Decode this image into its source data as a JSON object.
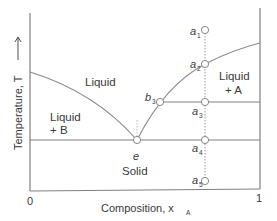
{
  "diagram": {
    "type": "phase-diagram",
    "title": "",
    "xlabel": "Composition, x",
    "xlabel_sub": "A",
    "ylabel": "Temperature, T",
    "ylabel_arrow": "→",
    "x_ticks": [
      "0",
      "1"
    ],
    "regions": {
      "liquid": "Liquid",
      "liquid_a_line1": "Liquid",
      "liquid_a_line2": "+ A",
      "liquid_b_line1": "Liquid",
      "liquid_b_line2": "+ B",
      "solid": "Solid"
    },
    "points": {
      "e": "e",
      "b3": "b",
      "b3_sub": "3",
      "a1": "a",
      "a1_sub": "1",
      "a2": "a",
      "a2_sub": "2",
      "a3": "a",
      "a3_sub": "3",
      "a4": "a",
      "a4_sub": "4",
      "a5": "a",
      "a5_sub": "5"
    },
    "colors": {
      "axis": "#808080",
      "curve": "#8a8a8a",
      "text": "#3a3a3a",
      "dotted": "#9a9a9a"
    }
  }
}
